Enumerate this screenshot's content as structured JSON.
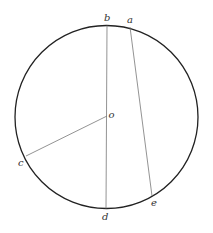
{
  "diagram": {
    "type": "geometry-circle",
    "circle": {
      "cx": 106.5,
      "cy": 117,
      "r": 91.5,
      "stroke": "#222222"
    },
    "points": {
      "a": {
        "label": "a",
        "x": 130,
        "y": 27
      },
      "b": {
        "label": "b",
        "x": 107,
        "y": 25.5
      },
      "c": {
        "label": "c",
        "x": 26,
        "y": 156
      },
      "d": {
        "label": "d",
        "x": 106,
        "y": 208.5
      },
      "e": {
        "label": "e",
        "x": 152,
        "y": 196
      },
      "o": {
        "label": "o",
        "x": 107,
        "y": 116
      }
    },
    "segments": [
      {
        "name": "diameter-bd",
        "from": "b",
        "to": "d"
      },
      {
        "name": "chord-ae",
        "from": "a",
        "to": "e"
      },
      {
        "name": "radius-oc",
        "from": "o",
        "to": "c"
      }
    ],
    "line_color": "#666666"
  }
}
